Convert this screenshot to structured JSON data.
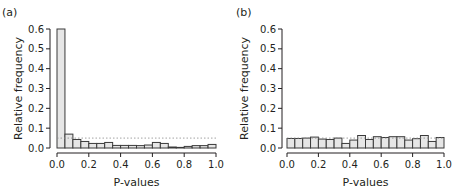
{
  "chart_data": [
    {
      "type": "bar",
      "panel_label": "(a)",
      "xlabel": "P-values",
      "ylabel": "Relative frequency",
      "ylim": [
        0,
        0.6
      ],
      "xlim": [
        0,
        1
      ],
      "yticks": [
        "0.0",
        "0.1",
        "0.2",
        "0.3",
        "0.4",
        "0.5",
        "0.6"
      ],
      "xticks": [
        "0.0",
        "0.2",
        "0.4",
        "0.6",
        "0.8",
        "1.0"
      ],
      "bin_width": 0.05,
      "categories": [
        "0.00-0.05",
        "0.05-0.10",
        "0.10-0.15",
        "0.15-0.20",
        "0.20-0.25",
        "0.25-0.30",
        "0.30-0.35",
        "0.35-0.40",
        "0.40-0.45",
        "0.45-0.50",
        "0.50-0.55",
        "0.55-0.60",
        "0.60-0.65",
        "0.65-0.70",
        "0.70-0.75",
        "0.75-0.80",
        "0.80-0.85",
        "0.85-0.90",
        "0.90-0.95",
        "0.95-1.00"
      ],
      "values": [
        0.6,
        0.07,
        0.043,
        0.033,
        0.023,
        0.023,
        0.028,
        0.013,
        0.013,
        0.013,
        0.012,
        0.015,
        0.028,
        0.023,
        0.005,
        0.003,
        0.008,
        0.012,
        0.012,
        0.018
      ],
      "reference_line": {
        "y": 0.05,
        "style": "dotted"
      },
      "grid": false
    },
    {
      "type": "bar",
      "panel_label": "(b)",
      "xlabel": "P-values",
      "ylabel": "Relative frequency",
      "ylim": [
        0,
        0.6
      ],
      "xlim": [
        0,
        1
      ],
      "yticks": [
        "0.0",
        "0.1",
        "0.2",
        "0.3",
        "0.4",
        "0.5",
        "0.6"
      ],
      "xticks": [
        "0.0",
        "0.2",
        "0.4",
        "0.6",
        "0.8",
        "1.0"
      ],
      "bin_width": 0.05,
      "categories": [
        "0.00-0.05",
        "0.05-0.10",
        "0.10-0.15",
        "0.15-0.20",
        "0.20-0.25",
        "0.25-0.30",
        "0.30-0.35",
        "0.35-0.40",
        "0.40-0.45",
        "0.45-0.50",
        "0.50-0.55",
        "0.55-0.60",
        "0.60-0.65",
        "0.65-0.70",
        "0.70-0.75",
        "0.75-0.80",
        "0.80-0.85",
        "0.85-0.90",
        "0.90-0.95",
        "0.95-1.00"
      ],
      "values": [
        0.048,
        0.048,
        0.05,
        0.055,
        0.045,
        0.043,
        0.05,
        0.023,
        0.04,
        0.063,
        0.043,
        0.057,
        0.053,
        0.057,
        0.057,
        0.04,
        0.047,
        0.063,
        0.033,
        0.053
      ],
      "reference_line": {
        "y": 0.05,
        "style": "dotted"
      },
      "grid": false
    }
  ],
  "colors": {
    "bar_fill": "#e6e6e6",
    "bar_stroke": "#3a3a3a",
    "axis": "#231f20",
    "reference_line": "#8a8a8a"
  }
}
